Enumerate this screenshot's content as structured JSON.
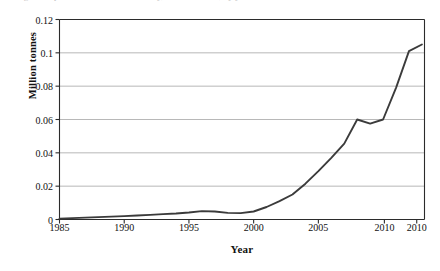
{
  "caption": {
    "clipped_text": "Figure — production of the commodity, million tonnes, by year"
  },
  "chart_data": {
    "type": "line",
    "title": "",
    "xlabel": "Year",
    "ylabel": "Million tonnes",
    "xlim": [
      1985,
      2013.2
    ],
    "ylim": [
      0,
      0.12
    ],
    "grid": "horizontal",
    "legend": "none",
    "line_color": "#3b3b3b",
    "xticks": [
      1985,
      1990,
      1995,
      2000,
      2005,
      2010,
      2010
    ],
    "xtick_positions": [
      1985,
      1990,
      1995,
      2000,
      2005,
      2010.1,
      2012.6
    ],
    "xtick_labels": [
      "1985",
      "1990",
      "1995",
      "2000",
      "2005",
      "2010",
      "2010"
    ],
    "yticks": [
      0,
      0.02,
      0.04,
      0.06,
      0.08,
      0.1,
      0.12
    ],
    "ytick_labels": [
      "0",
      "0.02",
      "0.04",
      "0.06",
      "0.08",
      "0.1",
      "0.12"
    ],
    "x": [
      1985,
      1986,
      1987,
      1988,
      1989,
      1990,
      1991,
      1992,
      1993,
      1994,
      1995,
      1996,
      1997,
      1998,
      1999,
      2000,
      2001,
      2002,
      2003,
      2004,
      2005,
      2006,
      2007,
      2008,
      2009,
      2010,
      2011,
      2012,
      2013
    ],
    "values": [
      0.0005,
      0.0008,
      0.0011,
      0.0014,
      0.0017,
      0.002,
      0.0024,
      0.0028,
      0.0032,
      0.0036,
      0.0042,
      0.005,
      0.0048,
      0.004,
      0.0038,
      0.0048,
      0.0075,
      0.011,
      0.015,
      0.0215,
      0.029,
      0.037,
      0.0455,
      0.06,
      0.0575,
      0.06,
      0.079,
      0.101,
      0.105
    ],
    "series_name": "Million tonnes",
    "annotations": [
      {
        "label": "local bump",
        "x": 1996,
        "y": 0.005
      },
      {
        "label": "plateau / notch",
        "x": 2009.5,
        "y": 0.06
      },
      {
        "label": "peak",
        "x": 2012.4,
        "y": 0.107
      }
    ]
  }
}
